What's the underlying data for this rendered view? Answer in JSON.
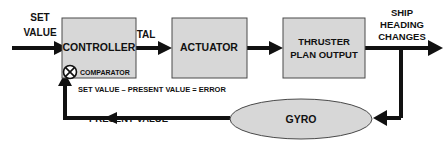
{
  "diagram": {
    "colors": {
      "background": "#ffffff",
      "block_fill": "#d7d7d7",
      "block_stroke": "#4a4a4a",
      "wire": "#111111",
      "text": "#111111"
    },
    "blocks": [
      {
        "id": "controller",
        "label": "CONTROLLER",
        "shape": "rect"
      },
      {
        "id": "actuator",
        "label": "ACTUATOR",
        "shape": "rect"
      },
      {
        "id": "thruster",
        "label_line1": "THRUSTER",
        "label_line2": "PLAN OUTPUT",
        "shape": "rect"
      },
      {
        "id": "gyro",
        "label": "GYRO",
        "shape": "ellipse"
      }
    ],
    "comparator": {
      "symbol_name": "circle-x-icon",
      "label": "COMPARATOR",
      "equation": "SET VALUE – PRESENT VALUE  =  ERROR"
    },
    "edges": [
      {
        "id": "set-value",
        "label_line1": "SET",
        "label_line2": "VALUE"
      },
      {
        "id": "tal",
        "label": "TAL"
      },
      {
        "id": "actuator-to-thruster",
        "label": ""
      },
      {
        "id": "ship-heading",
        "label_line1": "SHIP",
        "label_line2": "HEADING",
        "label_line3": "CHANGES"
      },
      {
        "id": "feedback",
        "label": "PRESENT VALUE"
      }
    ]
  }
}
